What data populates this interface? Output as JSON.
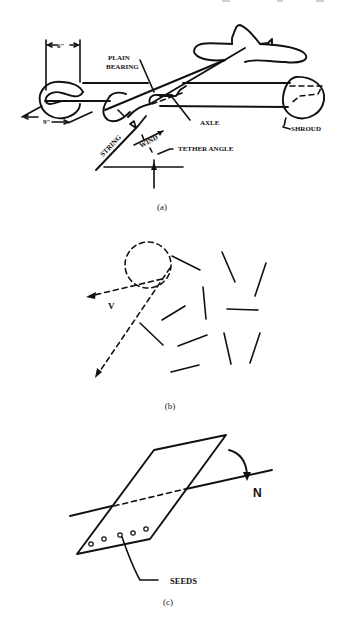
{
  "figure": {
    "panel_a": {
      "caption": "(a)",
      "labels": {
        "dimension_top": "6\"",
        "dimension_bottom": "9\"",
        "plain_bearing_line1": "PLAIN",
        "plain_bearing_line2": "BEARING",
        "axle": "AXLE",
        "shroud": "SHROUD",
        "string": "STRING",
        "wind": "WIND",
        "tether_angle": "TETHER ANGLE"
      }
    },
    "panel_b": {
      "caption": "(b)",
      "labels": {
        "velocity": "V"
      }
    },
    "panel_c": {
      "caption": "(c)",
      "labels": {
        "rotation": "N",
        "seeds": "SEEDS"
      },
      "seed_count": 5
    },
    "stroke_color": "#111111",
    "background": "#ffffff"
  }
}
